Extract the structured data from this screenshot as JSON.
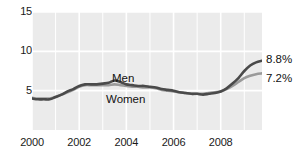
{
  "chart_data": {
    "type": "line",
    "title": "Unemployment Rate by\nGender",
    "xlabel": "",
    "ylabel": "",
    "xlim": [
      2000,
      2009.75
    ],
    "ylim": [
      0,
      15
    ],
    "yticks": [
      5,
      10,
      15
    ],
    "xticks": [
      2000,
      2002,
      2004,
      2006,
      2008
    ],
    "grid": true,
    "grid_color": "#ffffff",
    "plot_background": "#ebebeb",
    "legend": "inline-labels",
    "series": [
      {
        "name": "Men",
        "color": "#4a4a4a",
        "end_label": "8.8%",
        "x": [
          2000.0,
          2000.25,
          2000.5,
          2000.75,
          2001.0,
          2001.25,
          2001.5,
          2001.75,
          2002.0,
          2002.25,
          2002.5,
          2002.75,
          2003.0,
          2003.25,
          2003.5,
          2003.75,
          2004.0,
          2004.25,
          2004.5,
          2004.75,
          2005.0,
          2005.25,
          2005.5,
          2005.75,
          2006.0,
          2006.25,
          2006.5,
          2006.75,
          2007.0,
          2007.25,
          2007.5,
          2007.75,
          2008.0,
          2008.25,
          2008.5,
          2008.75,
          2009.0,
          2009.25,
          2009.5,
          2009.75
        ],
        "values": [
          4.0,
          3.9,
          3.9,
          3.9,
          4.2,
          4.5,
          4.9,
          5.2,
          5.6,
          5.8,
          5.8,
          5.8,
          5.9,
          6.0,
          6.3,
          6.1,
          5.8,
          5.7,
          5.6,
          5.6,
          5.5,
          5.4,
          5.2,
          5.1,
          5.0,
          4.8,
          4.7,
          4.6,
          4.6,
          4.5,
          4.6,
          4.7,
          4.9,
          5.3,
          5.9,
          6.6,
          7.5,
          8.2,
          8.6,
          8.8
        ]
      },
      {
        "name": "Women",
        "color": "#9a9a9a",
        "end_label": "7.2%",
        "x": [
          2000.0,
          2000.25,
          2000.5,
          2000.75,
          2001.0,
          2001.25,
          2001.5,
          2001.75,
          2002.0,
          2002.25,
          2002.5,
          2002.75,
          2003.0,
          2003.25,
          2003.5,
          2003.75,
          2004.0,
          2004.25,
          2004.5,
          2004.75,
          2005.0,
          2005.25,
          2005.5,
          2005.75,
          2006.0,
          2006.25,
          2006.5,
          2006.75,
          2007.0,
          2007.25,
          2007.5,
          2007.75,
          2008.0,
          2008.25,
          2008.5,
          2008.75,
          2009.0,
          2009.25,
          2009.5,
          2009.75
        ],
        "values": [
          4.1,
          4.0,
          4.0,
          4.0,
          4.2,
          4.5,
          4.8,
          5.1,
          5.5,
          5.7,
          5.7,
          5.7,
          5.7,
          5.7,
          5.8,
          5.7,
          5.6,
          5.5,
          5.5,
          5.4,
          5.4,
          5.3,
          5.1,
          5.0,
          4.9,
          4.8,
          4.7,
          4.6,
          4.6,
          4.6,
          4.7,
          4.8,
          4.9,
          5.2,
          5.6,
          6.1,
          6.6,
          6.9,
          7.1,
          7.2
        ]
      }
    ],
    "annotations": [
      {
        "text": "Men",
        "series": "Men"
      },
      {
        "text": "Women",
        "series": "Women"
      },
      {
        "text": "8.8%",
        "series": "Men"
      },
      {
        "text": "7.2%",
        "series": "Women"
      }
    ]
  },
  "axis": {
    "y_labels": [
      "15",
      "10",
      "5"
    ],
    "x_labels": [
      "2000",
      "2002",
      "2004",
      "2006",
      "2008"
    ]
  },
  "labels": {
    "men": "Men",
    "women": "Women",
    "men_end": "8.8%",
    "women_end": "7.2%"
  }
}
